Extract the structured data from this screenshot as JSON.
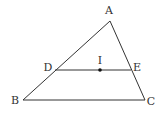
{
  "diagram": {
    "type": "geometry",
    "colors": {
      "stroke": "#333333",
      "text": "#333333",
      "background": "#ffffff",
      "point": "#111111"
    },
    "points": [
      {
        "id": "A",
        "label": "A",
        "x": 110,
        "y": 21,
        "lx": 109,
        "ly": 14
      },
      {
        "id": "B",
        "label": "B",
        "x": 23,
        "y": 100,
        "lx": 15,
        "ly": 104
      },
      {
        "id": "C",
        "label": "C",
        "x": 145,
        "y": 100,
        "lx": 151,
        "ly": 105
      },
      {
        "id": "D",
        "label": "D",
        "x": 55,
        "y": 70,
        "lx": 48,
        "ly": 71
      },
      {
        "id": "E",
        "label": "E",
        "x": 131,
        "y": 70,
        "lx": 137,
        "ly": 71
      },
      {
        "id": "I",
        "label": "I",
        "x": 100,
        "y": 70,
        "lx": 100,
        "ly": 64
      }
    ],
    "segments": [
      {
        "from": "A",
        "to": "B"
      },
      {
        "from": "A",
        "to": "C"
      },
      {
        "from": "B",
        "to": "C"
      },
      {
        "from": "D",
        "to": "E"
      }
    ],
    "marked_points": [
      "I"
    ]
  }
}
